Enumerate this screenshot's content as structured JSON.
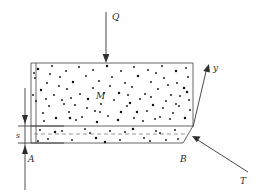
{
  "figure": {
    "type": "mechanics-free-body-diagram",
    "background_color": "#ffffff",
    "line_color": "#555555",
    "dash_color": "#8d8d8d",
    "dot_color": "#141414"
  },
  "labels": {
    "load": "Q",
    "body": "M",
    "axis_y": "y",
    "force_t": "T",
    "point_a": "A",
    "point_b": "B",
    "thickness": "s"
  },
  "geometry": {
    "block": {
      "left": 31,
      "top": 63,
      "right": 193,
      "bottom": 143,
      "interface_y": 126,
      "midline_y": 134,
      "bottom_right_x": 183
    },
    "load_arrow": {
      "x": 106,
      "y_start": 12,
      "y_end": 62
    },
    "y_axis_arrow": {
      "x1": 193,
      "y1": 127,
      "x2": 209,
      "y2": 64
    },
    "t_force_arrow": {
      "x1": 248,
      "y1": 172,
      "x2": 192,
      "y2": 136
    },
    "dimension_line": {
      "x": 25,
      "y_top": 88,
      "y_bottom": 190
    }
  },
  "dots": [
    [
      38,
      69
    ],
    [
      52,
      66
    ],
    [
      66,
      71
    ],
    [
      79,
      67
    ],
    [
      93,
      70
    ],
    [
      107,
      66
    ],
    [
      121,
      71
    ],
    [
      134,
      67
    ],
    [
      148,
      70
    ],
    [
      162,
      66
    ],
    [
      176,
      71
    ],
    [
      186,
      68
    ],
    [
      35,
      78
    ],
    [
      47,
      83
    ],
    [
      60,
      77
    ],
    [
      73,
      82
    ],
    [
      86,
      76
    ],
    [
      99,
      81
    ],
    [
      112,
      77
    ],
    [
      125,
      83
    ],
    [
      138,
      76
    ],
    [
      151,
      82
    ],
    [
      164,
      78
    ],
    [
      177,
      83
    ],
    [
      188,
      77
    ],
    [
      41,
      90
    ],
    [
      54,
      95
    ],
    [
      67,
      89
    ],
    [
      80,
      94
    ],
    [
      93,
      88
    ],
    [
      119,
      93
    ],
    [
      132,
      87
    ],
    [
      145,
      94
    ],
    [
      158,
      89
    ],
    [
      171,
      95
    ],
    [
      184,
      88
    ],
    [
      36,
      101
    ],
    [
      49,
      106
    ],
    [
      62,
      100
    ],
    [
      75,
      105
    ],
    [
      88,
      99
    ],
    [
      101,
      104
    ],
    [
      114,
      100
    ],
    [
      127,
      106
    ],
    [
      140,
      99
    ],
    [
      153,
      105
    ],
    [
      166,
      101
    ],
    [
      179,
      106
    ],
    [
      189,
      100
    ],
    [
      43,
      113
    ],
    [
      56,
      118
    ],
    [
      69,
      112
    ],
    [
      82,
      117
    ],
    [
      95,
      111
    ],
    [
      108,
      116
    ],
    [
      121,
      112
    ],
    [
      134,
      118
    ],
    [
      147,
      111
    ],
    [
      160,
      117
    ],
    [
      173,
      113
    ],
    [
      185,
      118
    ],
    [
      34,
      73
    ],
    [
      59,
      86
    ],
    [
      71,
      98
    ],
    [
      104,
      93
    ],
    [
      130,
      103
    ],
    [
      156,
      73
    ],
    [
      168,
      85
    ],
    [
      180,
      96
    ],
    [
      44,
      121
    ],
    [
      97,
      122
    ],
    [
      143,
      121
    ],
    [
      190,
      110
    ],
    [
      64,
      104
    ],
    [
      110,
      86
    ],
    [
      137,
      112
    ],
    [
      50,
      74
    ],
    [
      87,
      108
    ],
    [
      163,
      108
    ],
    [
      176,
      104
    ],
    [
      118,
      120
    ],
    [
      76,
      120
    ],
    [
      155,
      119
    ],
    [
      33,
      95
    ],
    [
      46,
      99
    ],
    [
      70,
      118
    ],
    [
      100,
      112
    ],
    [
      128,
      95
    ],
    [
      151,
      97
    ],
    [
      170,
      119
    ],
    [
      187,
      92
    ],
    [
      40,
      130
    ],
    [
      62,
      131
    ],
    [
      85,
      129
    ],
    [
      110,
      131
    ],
    [
      133,
      129
    ],
    [
      156,
      131
    ],
    [
      175,
      130
    ],
    [
      48,
      139
    ],
    [
      72,
      140
    ],
    [
      96,
      138
    ],
    [
      120,
      140
    ],
    [
      144,
      138
    ],
    [
      166,
      140
    ],
    [
      178,
      139
    ],
    [
      55,
      132
    ],
    [
      90,
      133
    ],
    [
      125,
      132
    ],
    [
      160,
      133
    ],
    [
      38,
      141
    ],
    [
      105,
      142
    ],
    [
      150,
      141
    ]
  ]
}
